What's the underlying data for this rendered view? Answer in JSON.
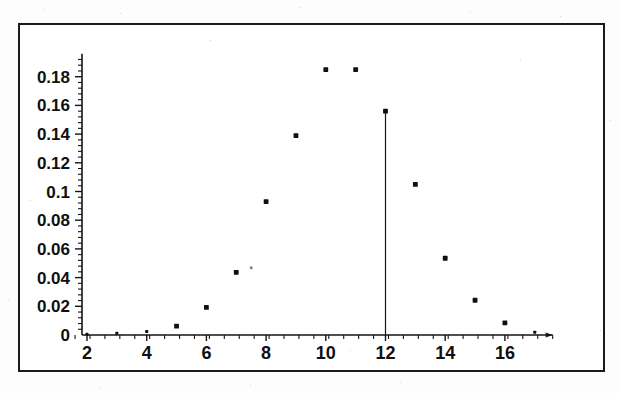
{
  "chart_data": {
    "type": "scatter",
    "title": "",
    "xlabel": "",
    "ylabel": "",
    "x": [
      2,
      3,
      4,
      5,
      6,
      7,
      8,
      9,
      10,
      11,
      12,
      13,
      14,
      15,
      16,
      17
    ],
    "values": [
      0.0005,
      0.0012,
      0.0025,
      0.0062,
      0.0192,
      0.0437,
      0.093,
      0.139,
      0.185,
      0.185,
      0.156,
      0.105,
      0.0535,
      0.0242,
      0.0085,
      0.002
    ],
    "extra_points": [
      {
        "x": 7.5,
        "y": 0.0468,
        "style": "faint-small"
      }
    ],
    "highlight": {
      "x": 12,
      "y": 0.156,
      "drop_line": true
    },
    "xlim": [
      1.6,
      17.6
    ],
    "ylim": [
      0,
      0.196
    ],
    "xticks": [
      2,
      4,
      6,
      8,
      10,
      12,
      14,
      16
    ],
    "xtick_labels": [
      "2",
      "4",
      "6",
      "8",
      "10",
      "12",
      "14",
      "16"
    ],
    "x_minor_step": 0.5,
    "yticks": [
      0,
      0.02,
      0.04,
      0.06,
      0.08,
      0.1,
      0.12,
      0.14,
      0.16,
      0.18
    ],
    "ytick_labels": [
      "0",
      "0.02",
      "0.04",
      "0.06",
      "0.08",
      "0.1",
      "0.12",
      "0.14",
      "0.16",
      "0.18"
    ],
    "y_minor_step": 0.004,
    "grid": false,
    "legend": null,
    "marker_color": "#101010",
    "axis_color": "#141414",
    "frame_color": "#1a1a1a",
    "background": "#ffffff"
  },
  "figure": {
    "border_label": "figure-border"
  }
}
